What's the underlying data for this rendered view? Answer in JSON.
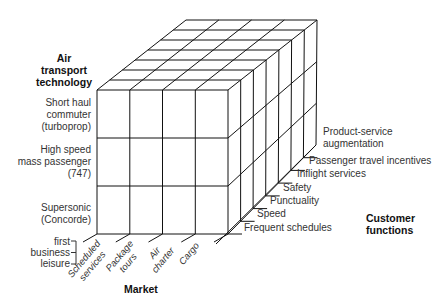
{
  "diagram": {
    "axes": {
      "vertical": {
        "title_lines": [
          "Air",
          "transport",
          "technology"
        ],
        "rows": [
          {
            "lines": [
              "Short haul",
              "commuter",
              "(turboprop)"
            ]
          },
          {
            "lines": [
              "High speed",
              "mass passenger",
              "(747)"
            ]
          },
          {
            "lines": [
              "Supersonic",
              "(Concorde)"
            ]
          }
        ],
        "class_bracket": [
          "first",
          "business",
          "leisure"
        ]
      },
      "horizontal": {
        "title": "Market",
        "columns": [
          {
            "lines": [
              "Scheduled",
              "services"
            ]
          },
          {
            "lines": [
              "Package",
              "tours"
            ]
          },
          {
            "lines": [
              "Air",
              "charter"
            ]
          },
          {
            "lines": [
              "Cargo"
            ]
          }
        ]
      },
      "depth": {
        "title_lines": [
          "Customer",
          "functions"
        ],
        "layers": [
          "Frequent schedules",
          "Speed",
          "Punctuality",
          "Safety",
          "Inflight services",
          "Passenger travel incentives",
          "Product-service augmentation"
        ],
        "last_layer_lines": [
          "Product-service",
          "augmentation"
        ]
      }
    },
    "colors": {
      "line": "#111111",
      "text": "#333333",
      "background": "#ffffff"
    }
  }
}
